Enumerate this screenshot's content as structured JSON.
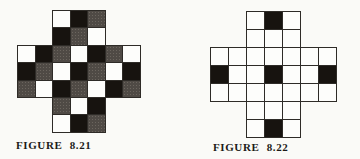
{
  "page": {
    "background": "#fafaf7"
  },
  "colors": {
    "black": "#17130f",
    "gray": "#4f4a45",
    "gray_dot": "#6b655e",
    "white": "#fdfdfb",
    "line": "#2e2b27",
    "text": "#1c1a17"
  },
  "figures": [
    {
      "caption": "FIGURE 8.21",
      "grid": {
        "rows": 7,
        "cols": 7,
        "shape": "cross-7x7-corners-2x2-removed",
        "cell_legend": {
          ".": "absent",
          "W": "white",
          "B": "black",
          "G": "gray"
        },
        "cells": [
          "..WBG..",
          "..BGW..",
          "WBGWBGW",
          "BGWBGWB",
          "GWBGWBG",
          "..GWB..",
          "..WBG.."
        ]
      }
    },
    {
      "caption": "FIGURE 8.22",
      "grid": {
        "rows": 7,
        "cols": 7,
        "shape": "cross-7x7-corners-2x2-removed",
        "cell_legend": {
          ".": "absent",
          "W": "white",
          "B": "black"
        },
        "cells": [
          "..WBW..",
          "..WWW..",
          "WWWWWWW",
          "BWWBWWB",
          "WWWWWWW",
          "..WWW..",
          "..WBW.."
        ]
      }
    }
  ]
}
